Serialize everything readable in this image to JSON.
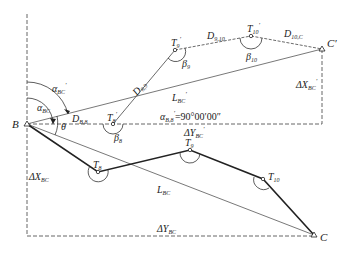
{
  "diagram": {
    "points": {
      "B": {
        "label": "B"
      },
      "C": {
        "label": "C"
      },
      "C_prime": {
        "label": "C",
        "prime": "′"
      },
      "T8": {
        "label": "T",
        "sub": "8"
      },
      "T9": {
        "label": "T",
        "sub": "9"
      },
      "T10": {
        "label": "T",
        "sub": "10"
      },
      "T8_prime": {
        "label": "T",
        "sub": "8",
        "prime": "′"
      },
      "T9_prime": {
        "label": "T",
        "sub": "9",
        "prime": "′"
      },
      "T10_prime": {
        "label": "T",
        "sub": "10",
        "prime": "′"
      }
    },
    "distances": {
      "D_B8": {
        "label": "D",
        "sub": "B,8"
      },
      "D_89": {
        "label": "D",
        "sub": "8,9"
      },
      "D_910": {
        "label": "D",
        "sub": "9,10"
      },
      "D_10C": {
        "label": "D",
        "sub": "10,C"
      },
      "L_BC": {
        "label": "L",
        "sub": "BC"
      },
      "L_BC_prime": {
        "label": "L",
        "sub": "BC",
        "prime": "′"
      }
    },
    "angles": {
      "alpha_BC": {
        "label": "α",
        "sub": "BC"
      },
      "alpha_BC_prime": {
        "label": "α",
        "sub": "BC",
        "prime": "′"
      },
      "alpha_B8_prime": {
        "label": "α",
        "sub": "B,8",
        "prime": "′",
        "value": "=90°00′00″"
      },
      "theta": {
        "label": "θ"
      },
      "beta8": {
        "label": "β",
        "sub": "8"
      },
      "beta9": {
        "label": "β",
        "sub": "9"
      },
      "beta10": {
        "label": "β",
        "sub": "10"
      }
    },
    "deltas": {
      "dX_BC": {
        "label": "ΔX",
        "sub": "BC"
      },
      "dY_BC": {
        "label": "ΔY",
        "sub": "BC"
      },
      "dX_BC_prime": {
        "label": "ΔX",
        "sub": "BC",
        "prime": "′"
      },
      "dY_BC_prime": {
        "label": "ΔY",
        "sub": "BC",
        "prime": "′"
      }
    }
  }
}
